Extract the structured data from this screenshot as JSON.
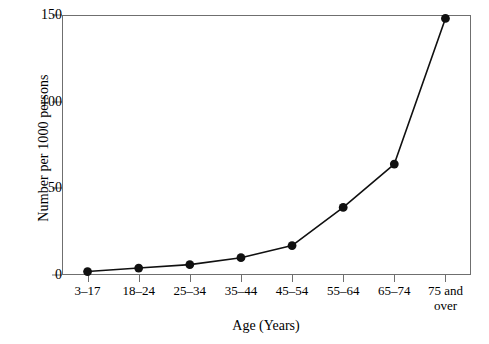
{
  "chart_data": {
    "type": "line",
    "title": "",
    "subtitle": "",
    "xlabel": "Age (Years)",
    "ylabel": "Number per 1000 persons",
    "categories": [
      "3–17",
      "18–24",
      "25–34",
      "35–44",
      "45–54",
      "55–64",
      "65–74",
      "75 and\nover"
    ],
    "values": [
      2,
      4,
      6,
      10,
      17,
      39,
      64,
      148
    ],
    "series": [
      {
        "name": "Number per 1000 persons",
        "values": [
          2,
          4,
          6,
          10,
          17,
          39,
          64,
          148
        ]
      }
    ],
    "ylim": [
      0,
      150
    ],
    "yticks": [
      0,
      50,
      100,
      150
    ],
    "ytick_labels": [
      "0",
      "50",
      "100",
      "150"
    ],
    "grid": false,
    "legend": false,
    "legend_position": "none",
    "marker": "filled-circle",
    "line_color": "#101010",
    "marker_color": "#101010",
    "axis_color": "#6f6f6f",
    "background_color": "#ffffff"
  }
}
